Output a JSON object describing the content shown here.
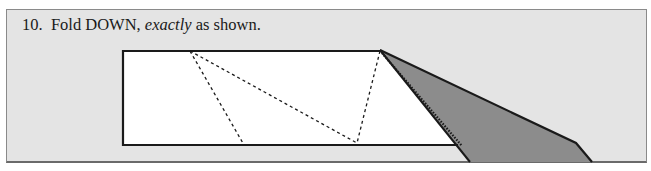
{
  "instruction": {
    "number": "10.",
    "text_before": "Fold DOWN,",
    "emphasis": "exactly",
    "text_after": "as shown."
  },
  "diagram": {
    "type": "origami-fold-step",
    "colors": {
      "paper": "#ffffff",
      "folded_flap": "#8c8c8c",
      "background": "#e4e4e4",
      "line": "#1a1a1a"
    },
    "lines": [
      "mountain-fold dashed",
      "valley-fold dashed",
      "solid edges"
    ]
  }
}
